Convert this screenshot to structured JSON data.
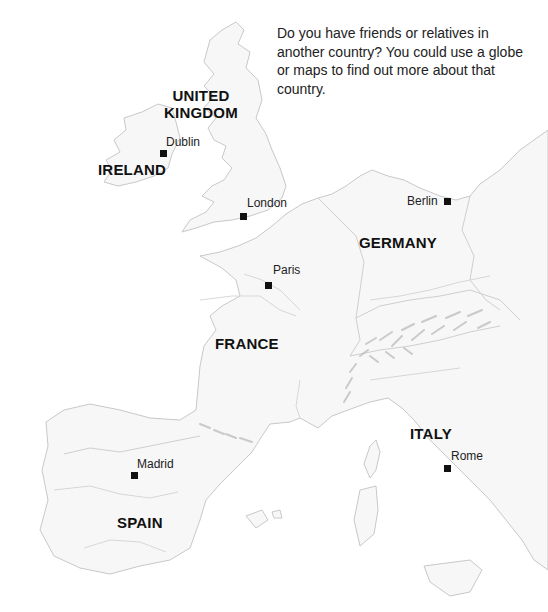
{
  "intro_text": "Do you have friends or relatives in another country? You could use a globe or maps to find out more about that country.",
  "countries": [
    {
      "name": "UNITED KINGDOM",
      "line1": "UNITED",
      "line2": "KINGDOM"
    },
    {
      "name": "IRELAND"
    },
    {
      "name": "GERMANY"
    },
    {
      "name": "FRANCE"
    },
    {
      "name": "ITALY"
    },
    {
      "name": "SPAIN"
    }
  ],
  "cities": [
    {
      "name": "Dublin"
    },
    {
      "name": "London"
    },
    {
      "name": "Berlin"
    },
    {
      "name": "Paris"
    },
    {
      "name": "Rome"
    },
    {
      "name": "Madrid"
    }
  ],
  "colors": {
    "land": "#f7f7f7",
    "coastline": "#c8c8c8",
    "text": "#111111",
    "marker": "#111111"
  }
}
